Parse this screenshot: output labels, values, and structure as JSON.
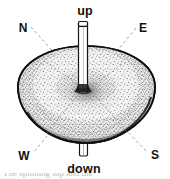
{
  "figure": {
    "type": "line-and-stipple illustration",
    "colors": {
      "ink": "#121212",
      "background": "#ffffff",
      "stipple": "#2b2b2b",
      "guide_line": "#8c8c8c"
    },
    "axis_labels": {
      "up": "up",
      "down": "down"
    },
    "compass_labels": {
      "north": "N",
      "east": "E",
      "west": "W",
      "south": "S"
    },
    "parts": {
      "body": "top-body",
      "rod_upper": "axis-rod-upper",
      "rod_lower": "axis-rod-lower",
      "hub": "center-hub"
    },
    "caption_cut": "The spinning top and the"
  }
}
